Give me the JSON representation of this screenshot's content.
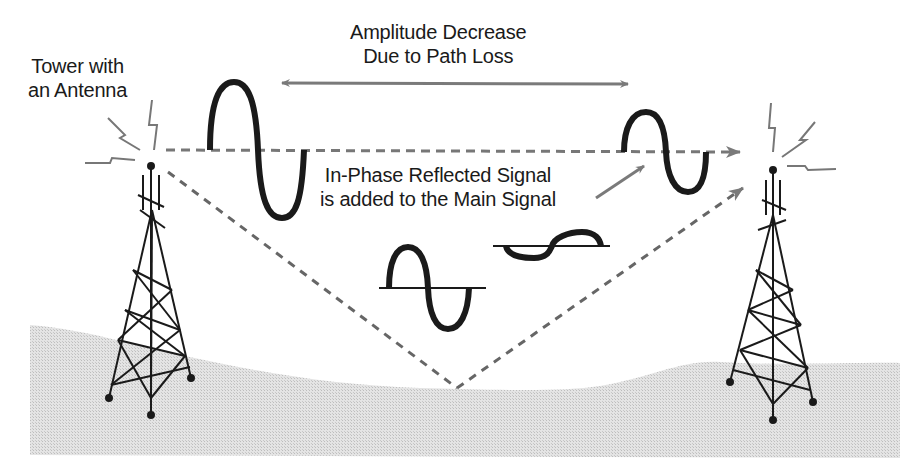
{
  "labels": {
    "tower": {
      "line1": "Tower with",
      "line2": "an Antenna"
    },
    "amplitude": {
      "line1": "Amplitude Decrease",
      "line2": "Due to Path Loss"
    },
    "inphase": {
      "line1": "In-Phase Reflected Signal",
      "line2": "is added to the Main Signal"
    }
  },
  "colors": {
    "ink": "#1a1a1a",
    "arrow_gray": "#7a7a7a",
    "ground": "#d9d9d9",
    "background": "#ffffff"
  },
  "elements": {
    "transmit_tower": "left lattice tower with antenna",
    "receive_tower": "right lattice tower with antenna",
    "direct_path": "dashed horizontal line with arrow to receiver",
    "reflected_path": "dashed V path bouncing off ground",
    "main_signal_large": "large sine wave near transmitter",
    "main_signal_small": "small sine wave near receiver",
    "reflected_signal": "sine wave in middle",
    "reflected_signal_small": "small in-phase sine wave",
    "amplitude_arrow": "double-headed gray arrow"
  }
}
